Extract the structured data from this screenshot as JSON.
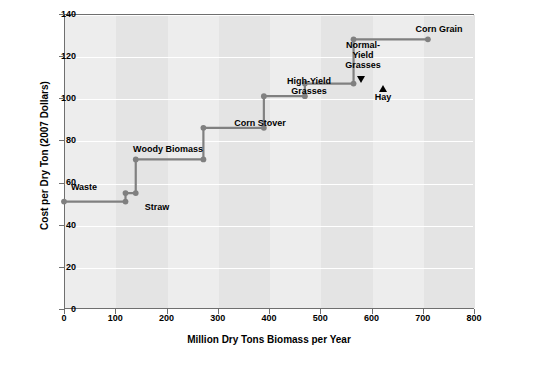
{
  "chart_data": {
    "type": "line",
    "title": "",
    "xlabel": "Million Dry Tons Biomass per Year",
    "ylabel": "Cost per Dry Ton (2007 Dollars)",
    "xlim": [
      0,
      800
    ],
    "ylim": [
      0,
      140
    ],
    "xticks": [
      0,
      100,
      200,
      300,
      400,
      500,
      600,
      700,
      800
    ],
    "yticks": [
      0,
      20,
      40,
      60,
      80,
      100,
      120,
      140
    ],
    "grid": "horizontal-white-lines",
    "legend": "none",
    "series": [
      {
        "name": "Biomass supply curve",
        "color": "#808080",
        "points": [
          {
            "x": 0,
            "y": 51,
            "marker": true
          },
          {
            "x": 120,
            "y": 51,
            "marker": true
          },
          {
            "x": 120,
            "y": 55,
            "marker": true
          },
          {
            "x": 140,
            "y": 55,
            "marker": true
          },
          {
            "x": 140,
            "y": 71,
            "marker": true
          },
          {
            "x": 272,
            "y": 71,
            "marker": true
          },
          {
            "x": 272,
            "y": 86,
            "marker": true
          },
          {
            "x": 390,
            "y": 86,
            "marker": true
          },
          {
            "x": 390,
            "y": 101,
            "marker": true
          },
          {
            "x": 470,
            "y": 101,
            "marker": true
          },
          {
            "x": 470,
            "y": 107,
            "marker": true
          },
          {
            "x": 565,
            "y": 107,
            "marker": true
          },
          {
            "x": 565,
            "y": 128,
            "marker": true
          },
          {
            "x": 710,
            "y": 128,
            "marker": true
          }
        ]
      }
    ],
    "annotations": [
      {
        "label": "Waste",
        "x": 60,
        "y": 58
      },
      {
        "label": "Straw",
        "x": 152,
        "y": 47
      },
      {
        "label": "Woody Biomass",
        "x": 178,
        "y": 78
      },
      {
        "label": "Corn Stover",
        "x": 300,
        "y": 93
      },
      {
        "label": "High-Yield\nGrasses",
        "x": 372,
        "y": 111
      },
      {
        "label": "Normal-\nYield\nGrasses",
        "x": 523,
        "y": 126
      },
      {
        "label": "Hay",
        "x": 575,
        "y": 102
      },
      {
        "label": "Corn Grain",
        "x": 640,
        "y": 135
      }
    ]
  }
}
